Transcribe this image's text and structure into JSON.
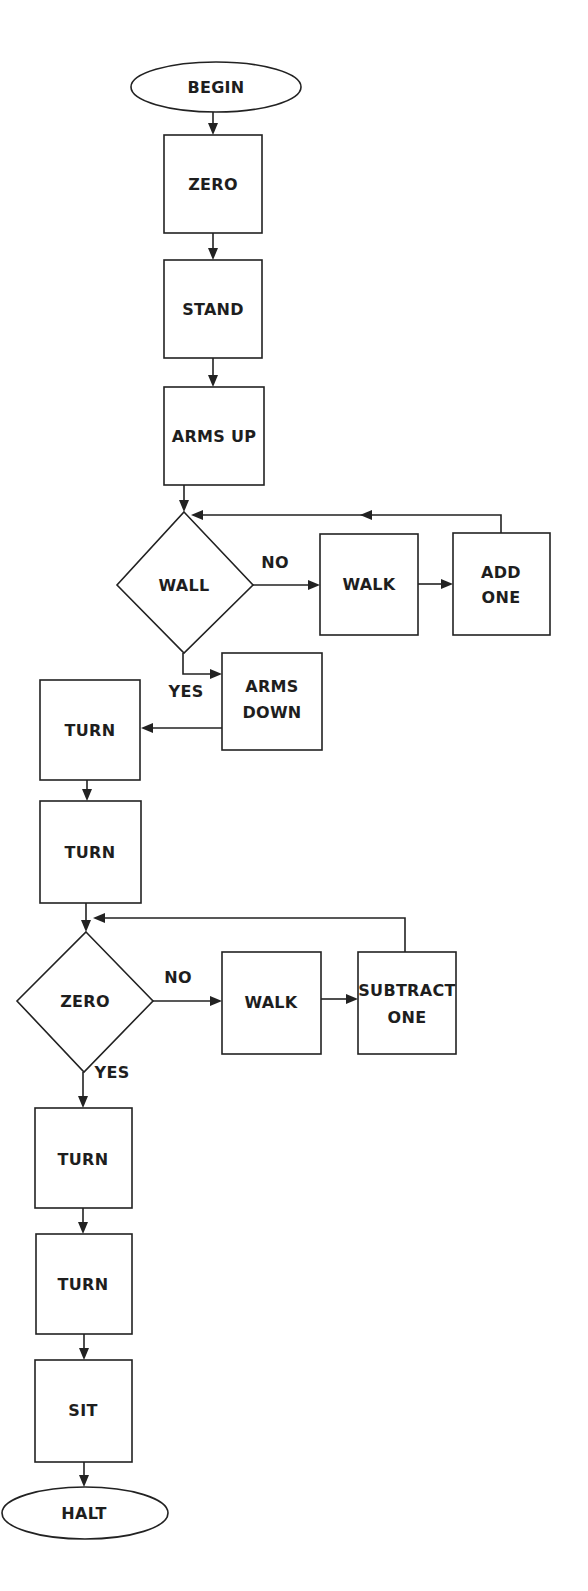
{
  "diagram": {
    "type": "flowchart",
    "nodes": {
      "begin": "BEGIN",
      "zero_box": "ZERO",
      "stand": "STAND",
      "arms_up": "ARMS UP",
      "wall_decision": "WALL",
      "walk_1": "WALK",
      "add_one_line1": "ADD",
      "add_one_line2": "ONE",
      "arms_down_line1": "ARMS",
      "arms_down_line2": "DOWN",
      "turn_1": "TURN",
      "turn_2": "TURN",
      "zero_decision": "ZERO",
      "walk_2": "WALK",
      "subtract_one_line1": "SUBTRACT",
      "subtract_one_line2": "ONE",
      "turn_3": "TURN",
      "turn_4": "TURN",
      "sit": "SIT",
      "halt": "HALT"
    },
    "edge_labels": {
      "wall_no": "NO",
      "wall_yes": "YES",
      "zero_no": "NO",
      "zero_yes": "YES"
    },
    "colors": {
      "stroke": "#222222",
      "text": "#1e1e1e",
      "background": "#ffffff"
    }
  }
}
